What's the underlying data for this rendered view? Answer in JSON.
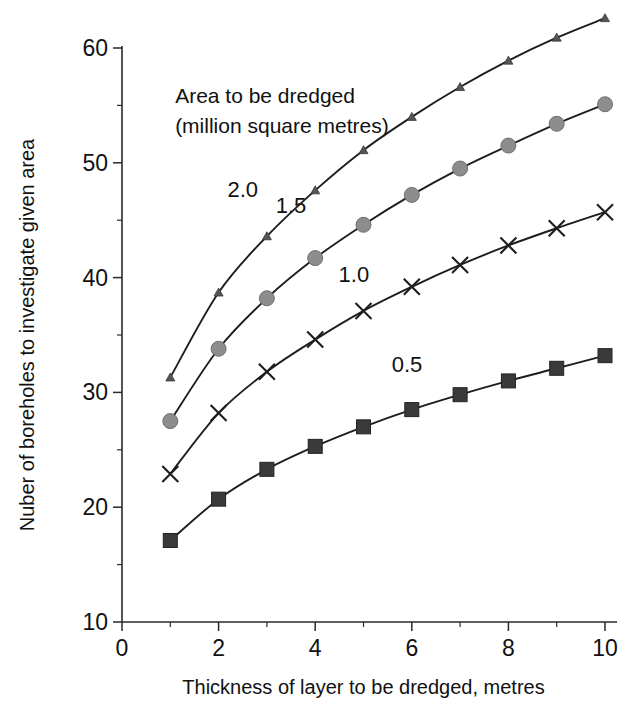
{
  "chart_data": {
    "type": "line",
    "title": "",
    "xlabel": "Thickness of layer to be dredged, metres",
    "ylabel": "Nuber of  boreholes to investigate given area",
    "xlim": [
      0,
      10
    ],
    "ylim": [
      10,
      60
    ],
    "xticks": [
      0,
      2,
      4,
      6,
      8,
      10
    ],
    "xticklabels": [
      "0",
      "2",
      "4",
      "6",
      "8",
      "10"
    ],
    "xminorticks": [
      1,
      3,
      5,
      7,
      9
    ],
    "yticks": [
      10,
      20,
      30,
      40,
      50,
      60
    ],
    "yticklabels": [
      "10",
      "20",
      "30",
      "40",
      "50",
      "60"
    ],
    "grid": false,
    "legend": "inline-curve-labels",
    "annotations": [
      {
        "text": "Area to be dredged",
        "x": 1.1,
        "y": 55.2
      },
      {
        "text": "(million  square metres)",
        "x": 1.1,
        "y": 52.6
      }
    ],
    "x": [
      1,
      2,
      3,
      4,
      5,
      6,
      7,
      8,
      9,
      10
    ],
    "series": [
      {
        "name": "0.5",
        "label": "0.5",
        "marker": "square",
        "color": "#3a3a3a",
        "label_x": 5.9,
        "label_y": 31.8,
        "values": [
          17.1,
          20.7,
          23.3,
          25.3,
          27.0,
          28.5,
          29.8,
          31.0,
          32.1,
          33.2
        ]
      },
      {
        "name": "1.0",
        "label": "1.0",
        "marker": "cross",
        "color": "#1d1d1d",
        "label_x": 4.8,
        "label_y": 39.6,
        "values": [
          22.9,
          28.2,
          31.8,
          34.6,
          37.1,
          39.2,
          41.1,
          42.8,
          44.3,
          45.7
        ]
      },
      {
        "name": "1.5",
        "label": "1.5",
        "marker": "circle",
        "color": "#8d8d8d",
        "label_x": 3.5,
        "label_y": 45.6,
        "values": [
          27.5,
          33.8,
          38.2,
          41.7,
          44.6,
          47.2,
          49.5,
          51.5,
          53.4,
          55.1
        ]
      },
      {
        "name": "2.0",
        "label": "2.0",
        "marker": "triangle",
        "color": "#555555",
        "label_x": 2.5,
        "label_y": 47.0,
        "values": [
          31.3,
          38.7,
          43.6,
          47.6,
          51.1,
          54.0,
          56.6,
          58.9,
          60.9,
          62.6
        ]
      }
    ]
  }
}
